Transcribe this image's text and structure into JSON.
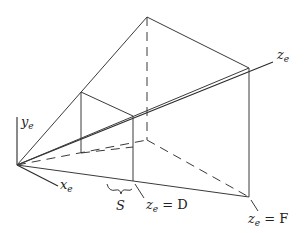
{
  "figure": {
    "labels": {
      "y_axis": "y",
      "x_axis": "x",
      "z_axis": "z",
      "subscript": "e",
      "spacing": "S",
      "near_plane": "= D",
      "far_plane": "= F"
    },
    "geometry": {
      "origin": [
        17,
        165
      ],
      "near_plane": {
        "top_left": [
          81,
          92
        ],
        "top_right": [
          133,
          116
        ],
        "bottom_right": [
          133,
          181
        ],
        "bottom_left": [
          81,
          153
        ]
      },
      "far_plane": {
        "top_left": [
          147,
          17
        ],
        "top_right": [
          249,
          68
        ],
        "bottom_right": [
          249,
          197
        ],
        "bottom_left": [
          147,
          140
        ]
      },
      "z_axis_end": [
        273,
        62
      ],
      "y_axis_end": [
        17,
        117
      ],
      "x_axis_end": [
        58,
        186
      ]
    },
    "stroke_color": "#3a3a3a"
  }
}
